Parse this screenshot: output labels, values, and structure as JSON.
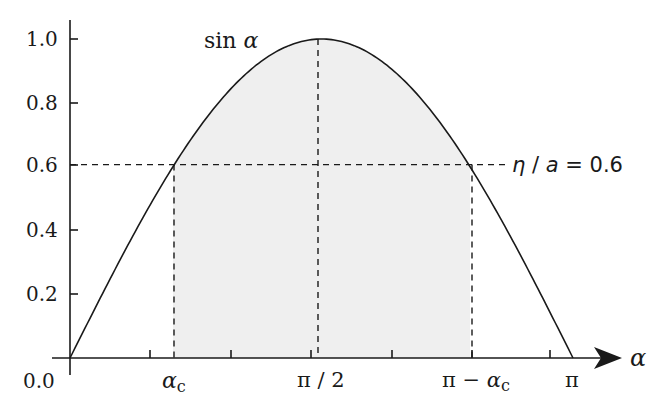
{
  "chart_data": {
    "type": "line",
    "title": "",
    "xlabel": "α",
    "ylabel": "",
    "function": "sin α",
    "curve_label": "sin α",
    "x_range": [
      0,
      3.14159
    ],
    "ylim": [
      0.0,
      1.0
    ],
    "grid": false,
    "legend": "none",
    "y_ticks": [
      0.0,
      0.2,
      0.4,
      0.6,
      0.8,
      1.0
    ],
    "y_tick_labels": [
      "0.0",
      "0.2",
      "0.4",
      "0.6",
      "0.8",
      "1.0"
    ],
    "x_tick_labels": [
      "α_c",
      "π/2",
      "π − α_c",
      "π"
    ],
    "x_tick_label_values": [
      0.6435,
      1.5708,
      2.4981,
      3.14159
    ],
    "x_minor_ticks_count": 7,
    "series": [
      {
        "name": "sin α",
        "x": [
          0,
          0.3927,
          0.6435,
          0.7854,
          1.1781,
          1.5708,
          1.9635,
          2.3562,
          2.4981,
          2.7489,
          3.14159
        ],
        "values": [
          0,
          0.383,
          0.6,
          0.707,
          0.924,
          1.0,
          0.924,
          0.707,
          0.6,
          0.383,
          0
        ]
      }
    ],
    "annotations": [
      {
        "type": "hline",
        "y": 0.6,
        "style": "dashed",
        "label": "η / a = 0.6"
      },
      {
        "type": "vline",
        "x": 0.6435,
        "style": "dashed",
        "label": "α_c"
      },
      {
        "type": "vline",
        "x": 1.5708,
        "style": "dashed",
        "label": "π/2"
      },
      {
        "type": "vline",
        "x": 2.4981,
        "style": "dashed",
        "label": "π − α_c"
      },
      {
        "type": "shaded_region",
        "x_from": 0.6435,
        "x_to": 2.4981,
        "under": "sin α",
        "color": "#efefef"
      }
    ]
  },
  "labels": {
    "y0": "0.0",
    "y02": "0.2",
    "y04": "0.4",
    "y06": "0.6",
    "y08": "0.8",
    "y10": "1.0",
    "curve": "sin α",
    "threshold": "η / a = 0.6",
    "x_alpha": "α",
    "x_alpha_c_main": "α",
    "x_alpha_c_sub": "c",
    "x_pi_half": "π / 2",
    "x_pi_minus": "π − α",
    "x_pi_minus_sub": "c",
    "x_pi": "π"
  },
  "colors": {
    "line": "#1a1a1a",
    "shade": "#efefef",
    "background": "#ffffff"
  }
}
